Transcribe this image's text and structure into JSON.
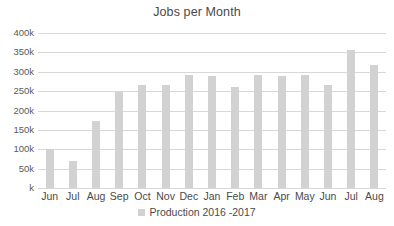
{
  "chart_data": {
    "type": "bar",
    "title": "Jobs per Month",
    "xlabel": "",
    "ylabel": "",
    "ylim": [
      0,
      400
    ],
    "y_unit": "k",
    "grid": true,
    "legend_position": "bottom",
    "y_ticks": [
      {
        "value": 400,
        "label": "400k"
      },
      {
        "value": 350,
        "label": "350k"
      },
      {
        "value": 300,
        "label": "300k"
      },
      {
        "value": 250,
        "label": "250k"
      },
      {
        "value": 200,
        "label": "200k"
      },
      {
        "value": 150,
        "label": "150k"
      },
      {
        "value": 100,
        "label": "100k"
      },
      {
        "value": 50,
        "label": "50k"
      },
      {
        "value": 0,
        "label": "k"
      }
    ],
    "categories": [
      "Jun",
      "Jul",
      "Aug",
      "Sep",
      "Oct",
      "Nov",
      "Dec",
      "Jan",
      "Feb",
      "Mar",
      "Apr",
      "May",
      "Jun",
      "Jul",
      "Aug"
    ],
    "series": [
      {
        "name": "Production 2016 -2017",
        "color": "#d2d2d2",
        "values": [
          100,
          70,
          172,
          248,
          265,
          267,
          292,
          288,
          260,
          291,
          290,
          292,
          265,
          356,
          318
        ]
      }
    ]
  },
  "legend": {
    "entries": [
      {
        "label": "Production 2016 -2017",
        "color": "#d2d2d2"
      }
    ]
  }
}
